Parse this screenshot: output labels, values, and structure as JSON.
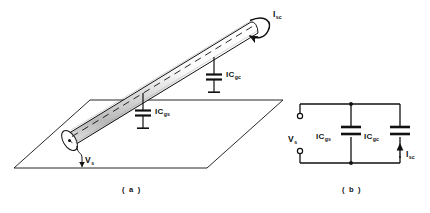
{
  "figure": {
    "title_a_caption": "( a )",
    "title_b_caption": "( b )",
    "panel_a": {
      "name": "cable-over-ground-plane",
      "labels": {
        "current_sc": {
          "base": "I",
          "sub": "sc"
        },
        "cap_gc": {
          "base": "IC",
          "sub": "gc"
        },
        "cap_gs": {
          "base": "IC",
          "sub": "gs"
        },
        "voltage_s": {
          "base": "V",
          "sub": "s"
        }
      }
    },
    "panel_b": {
      "name": "equivalent-lumped-circuit",
      "labels": {
        "source_voltage": {
          "base": "V",
          "sub": "s"
        },
        "cap_left": {
          "base": "IC",
          "sub": "gs"
        },
        "cap_right": {
          "base": "IC",
          "sub": "gc"
        },
        "current_sc": {
          "base": "I",
          "sub": "sc"
        }
      }
    },
    "colors": {
      "ink": "#111111",
      "background": "#ffffff",
      "shading": "#c9c9c9"
    }
  }
}
